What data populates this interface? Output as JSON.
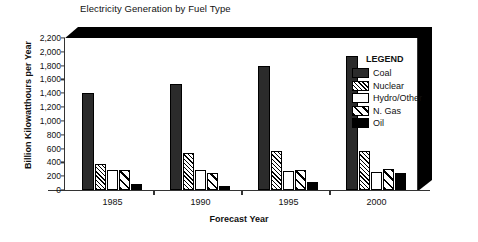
{
  "chart_data": {
    "type": "bar",
    "title": "Electricity Generation by Fuel Type",
    "xlabel": "Forecast Year",
    "ylabel": "Billion Kilowatthours per Year",
    "categories": [
      "1985",
      "1990",
      "1995",
      "2000"
    ],
    "ylim": [
      0,
      2200
    ],
    "yticks": [
      "0",
      "200",
      "400",
      "600",
      "800",
      "1,000",
      "1,200",
      "1,400",
      "1,600",
      "1,800",
      "2,000",
      "2,200"
    ],
    "ytick_values": [
      0,
      200,
      400,
      600,
      800,
      1000,
      1200,
      1400,
      1600,
      1800,
      2000,
      2200
    ],
    "grid": false,
    "legend_position": "inside-top-right",
    "legend_title": "LEGEND",
    "series": [
      {
        "name": "Coal",
        "pattern": "solid-dark",
        "color": "#2b2b2b",
        "values": [
          1400,
          1540,
          1790,
          1945
        ]
      },
      {
        "name": "Nuclear",
        "pattern": "dense-hatch",
        "color": "#ffffff",
        "values": [
          380,
          540,
          560,
          570
        ]
      },
      {
        "name": "Hydro/Other",
        "pattern": "empty-white",
        "color": "#ffffff",
        "values": [
          290,
          285,
          275,
          260
        ]
      },
      {
        "name": "N. Gas",
        "pattern": "diagonal-stripe",
        "color": "#ffffff",
        "values": [
          290,
          245,
          290,
          300
        ]
      },
      {
        "name": "Oil",
        "pattern": "solid-black",
        "color": "#000000",
        "values": [
          90,
          60,
          120,
          240
        ]
      }
    ]
  }
}
